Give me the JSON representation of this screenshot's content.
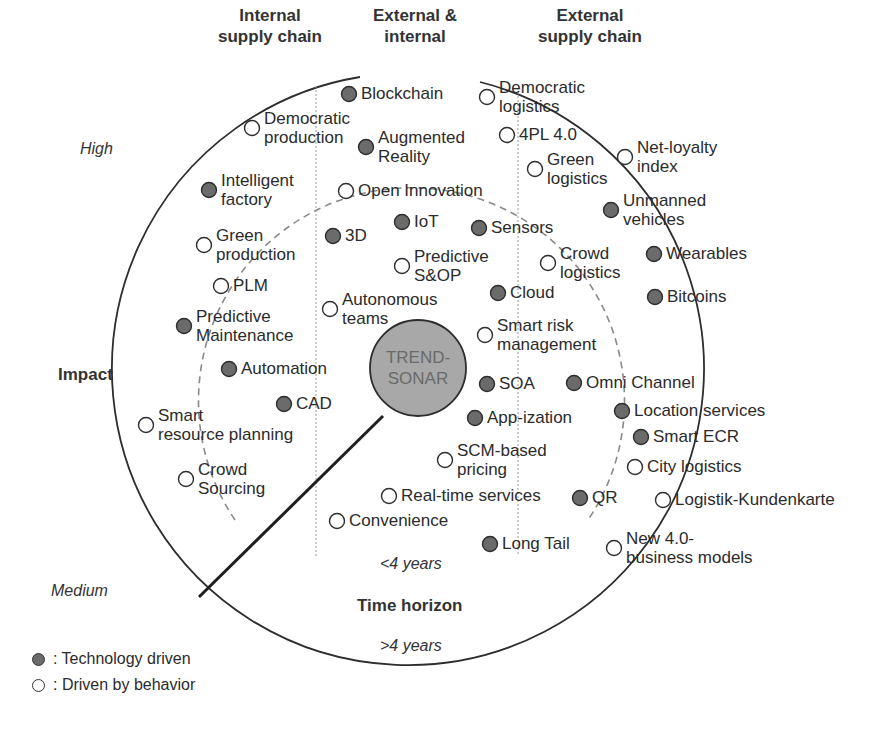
{
  "chart_data": {
    "type": "radar-diagram",
    "center_label": [
      "TREND-",
      "SONAR"
    ],
    "column_headers": [
      {
        "line1": "Internal",
        "line2": "supply chain"
      },
      {
        "line1": "External &",
        "line2": "internal"
      },
      {
        "line1": "External",
        "line2": "supply chain"
      }
    ],
    "impact_axis": {
      "title": "Impact",
      "high": "High",
      "medium": "Medium"
    },
    "time_axis": {
      "title": "Time horizon",
      "inner": "<4 years",
      "outer": ">4 years"
    },
    "legend": [
      {
        "type": "technology",
        "label": ": Technology driven",
        "color": "#6b6b6b"
      },
      {
        "type": "behavior",
        "label": ": Driven by behavior",
        "color": "#ffffff"
      }
    ],
    "items": [
      {
        "label": [
          "Blockchain"
        ],
        "type": "technology",
        "x": 349,
        "y": 94
      },
      {
        "label": [
          "Democratic",
          "production"
        ],
        "type": "behavior",
        "x": 252,
        "y": 128
      },
      {
        "label": [
          "Augmented",
          "Reality"
        ],
        "type": "technology",
        "x": 366,
        "y": 147
      },
      {
        "label": [
          "Democratic",
          "logistics"
        ],
        "type": "behavior",
        "x": 487,
        "y": 97
      },
      {
        "label": [
          "4PL 4.0"
        ],
        "type": "behavior",
        "x": 507,
        "y": 135
      },
      {
        "label": [
          "Green",
          "logistics"
        ],
        "type": "behavior",
        "x": 535,
        "y": 169
      },
      {
        "label": [
          "Net-loyalty",
          "index"
        ],
        "type": "behavior",
        "x": 625,
        "y": 157
      },
      {
        "label": [
          "Intelligent",
          "factory"
        ],
        "type": "technology",
        "x": 209,
        "y": 190
      },
      {
        "label": [
          "Open Innovation"
        ],
        "type": "behavior",
        "x": 346,
        "y": 191
      },
      {
        "label": [
          "Unmanned",
          "vehicles"
        ],
        "type": "technology",
        "x": 611,
        "y": 210
      },
      {
        "label": [
          "IoT"
        ],
        "type": "technology",
        "x": 402,
        "y": 222
      },
      {
        "label": [
          "Sensors"
        ],
        "type": "technology",
        "x": 479,
        "y": 228
      },
      {
        "label": [
          "3D"
        ],
        "type": "technology",
        "x": 333,
        "y": 236
      },
      {
        "label": [
          "Green",
          "production"
        ],
        "type": "behavior",
        "x": 204,
        "y": 245
      },
      {
        "label": [
          "Predictive",
          "S&OP"
        ],
        "type": "behavior",
        "x": 402,
        "y": 266
      },
      {
        "label": [
          "Crowd",
          "logistics"
        ],
        "type": "behavior",
        "x": 548,
        "y": 263
      },
      {
        "label": [
          "Wearables"
        ],
        "type": "technology",
        "x": 654,
        "y": 254
      },
      {
        "label": [
          "PLM"
        ],
        "type": "behavior",
        "x": 221,
        "y": 286
      },
      {
        "label": [
          "Cloud"
        ],
        "type": "technology",
        "x": 498,
        "y": 293
      },
      {
        "label": [
          "Bitcoins"
        ],
        "type": "technology",
        "x": 655,
        "y": 297
      },
      {
        "label": [
          "Autonomous",
          "teams"
        ],
        "type": "behavior",
        "x": 330,
        "y": 309
      },
      {
        "label": [
          "Predictive",
          "Maintenance"
        ],
        "type": "technology",
        "x": 184,
        "y": 326
      },
      {
        "label": [
          "Smart risk",
          "management"
        ],
        "type": "behavior",
        "x": 485,
        "y": 335
      },
      {
        "label": [
          "Automation"
        ],
        "type": "technology",
        "x": 229,
        "y": 369
      },
      {
        "label": [
          "SOA"
        ],
        "type": "technology",
        "x": 487,
        "y": 384
      },
      {
        "label": [
          "Omni Channel"
        ],
        "type": "technology",
        "x": 574,
        "y": 383
      },
      {
        "label": [
          "CAD"
        ],
        "type": "technology",
        "x": 284,
        "y": 404
      },
      {
        "label": [
          "App-ization"
        ],
        "type": "technology",
        "x": 475,
        "y": 418
      },
      {
        "label": [
          "Location services"
        ],
        "type": "technology",
        "x": 622,
        "y": 411
      },
      {
        "label": [
          "Smart",
          "resource planning"
        ],
        "type": "behavior",
        "x": 146,
        "y": 425
      },
      {
        "label": [
          "Smart ECR"
        ],
        "type": "technology",
        "x": 641,
        "y": 437
      },
      {
        "label": [
          "SCM-based",
          "pricing"
        ],
        "type": "behavior",
        "x": 445,
        "y": 460
      },
      {
        "label": [
          "City logistics"
        ],
        "type": "behavior",
        "x": 635,
        "y": 467
      },
      {
        "label": [
          "Crowd",
          "Sourcing"
        ],
        "type": "behavior",
        "x": 186,
        "y": 479
      },
      {
        "label": [
          "Real-time services"
        ],
        "type": "behavior",
        "x": 389,
        "y": 496
      },
      {
        "label": [
          "QR"
        ],
        "type": "technology",
        "x": 580,
        "y": 498
      },
      {
        "label": [
          "Logistik-Kundenkarte"
        ],
        "type": "behavior",
        "x": 663,
        "y": 500
      },
      {
        "label": [
          "Convenience"
        ],
        "type": "behavior",
        "x": 337,
        "y": 521
      },
      {
        "label": [
          "Long Tail"
        ],
        "type": "technology",
        "x": 490,
        "y": 544
      },
      {
        "label": [
          "New 4.0-",
          "business models"
        ],
        "type": "behavior",
        "x": 614,
        "y": 548
      }
    ]
  },
  "colors": {
    "tech_fill": "#6b6b6b",
    "behavior_fill": "#ffffff",
    "sonar_fill": "#a8a8a8",
    "stroke": "#2d2d2d",
    "dashed": "#8a8a8a"
  }
}
